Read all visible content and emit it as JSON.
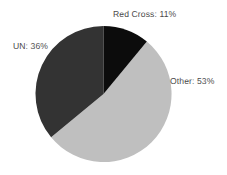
{
  "chart_data": {
    "type": "pie",
    "title": "",
    "subtitle": "",
    "xlabel": "",
    "ylabel": "",
    "legend_position": "none",
    "grid": false,
    "start_angle_deg": 0,
    "direction": "clockwise",
    "categories": [
      "Red Cross",
      "UN",
      "Other"
    ],
    "values": [
      11,
      36,
      53
    ],
    "value_unit": "%",
    "slices": [
      {
        "name": "Red Cross",
        "value": 11,
        "label": "Red Cross: 11%",
        "color": "#0c0c0c",
        "start_deg": 0,
        "end_deg": 39.6
      },
      {
        "name": "Other",
        "value": 53,
        "label": "Other: 53%",
        "color": "#bfbfbf",
        "start_deg": 39.6,
        "end_deg": 230.4
      },
      {
        "name": "UN",
        "value": 36,
        "label": "UN: 36%",
        "color": "#333333",
        "start_deg": 230.4,
        "end_deg": 360
      }
    ]
  },
  "canvas": {
    "background_color": "#ffffff",
    "center_x": 103.5,
    "center_y": 94,
    "radius": 68
  },
  "labels": {
    "red_cross": "Red Cross: 11%",
    "un": "UN: 36%",
    "other": "Other: 53%",
    "text_color": "#4a4a4a"
  }
}
